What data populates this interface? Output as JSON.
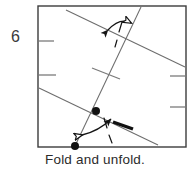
{
  "figure": {
    "step_label": "6",
    "caption": "Fold and unfold.",
    "colors": {
      "border": "#3c3c3c",
      "crease_line": "#6d6d6d",
      "tick": "#7a7a7a",
      "dot": "#111111",
      "arrow": "#141414",
      "thick_mark": "#111111",
      "text": "#2b2b2b",
      "background": "#ffffff"
    },
    "diagram": {
      "type": "origami-crease-pattern",
      "square": {
        "x": 38,
        "y": 6,
        "width": 148,
        "height": 141
      },
      "crease_lines": [
        {
          "name": "upper-fold-line",
          "x1": 66,
          "y1": 10,
          "x2": 185,
          "y2": 67,
          "style": "solid"
        },
        {
          "name": "lower-fold-line",
          "x1": 39,
          "y1": 88,
          "x2": 158,
          "y2": 145,
          "style": "solid"
        },
        {
          "name": "steep-reference-line",
          "x1": 141,
          "y1": 7,
          "x2": 75,
          "y2": 146,
          "style": "solid"
        }
      ],
      "edge_ticks": [
        {
          "name": "left-tick-upper",
          "x1": 39,
          "y1": 41,
          "x2": 54,
          "y2": 41
        },
        {
          "name": "left-tick-lower",
          "x1": 39,
          "y1": 75,
          "x2": 56,
          "y2": 75
        },
        {
          "name": "right-tick-upper",
          "x1": 170,
          "y1": 76,
          "x2": 186,
          "y2": 76
        },
        {
          "name": "right-tick-lower",
          "x1": 170,
          "y1": 107,
          "x2": 186,
          "y2": 107
        },
        {
          "name": "center-cross-tick",
          "x1": 92,
          "y1": 68,
          "x2": 120,
          "y2": 79
        }
      ],
      "dots": [
        {
          "name": "intersection-dot",
          "cx": 96,
          "cy": 111,
          "r": 4
        },
        {
          "name": "edge-dot",
          "cx": 75,
          "cy": 146,
          "r": 4
        }
      ],
      "thick_mark": {
        "name": "thick-crease-mark",
        "x1": 113,
        "y1": 122,
        "x2": 133,
        "y2": 129
      },
      "fold_arrows": [
        {
          "name": "top-fold-arrow",
          "dashed_line": {
            "x1": 122,
            "y1": 22,
            "x2": 115,
            "y2": 46
          },
          "curve": "M 106,30 Q 119,17 132,23",
          "solid_head": {
            "tip_x": 102,
            "tip_y": 33,
            "angle": 205
          },
          "hollow_head": {
            "tip_x": 137,
            "tip_y": 22,
            "angle": 20
          }
        },
        {
          "name": "bottom-fold-arrow",
          "dashed_line": {
            "x1": 104,
            "y1": 118,
            "x2": 112,
            "y2": 142
          },
          "curve": "M 80,135 Q 98,130 110,118",
          "solid_head": {
            "tip_x": 115,
            "tip_y": 114,
            "angle": 315
          },
          "hollow_head": {
            "tip_x": 75,
            "tip_y": 137,
            "angle": 170
          }
        }
      ]
    }
  }
}
